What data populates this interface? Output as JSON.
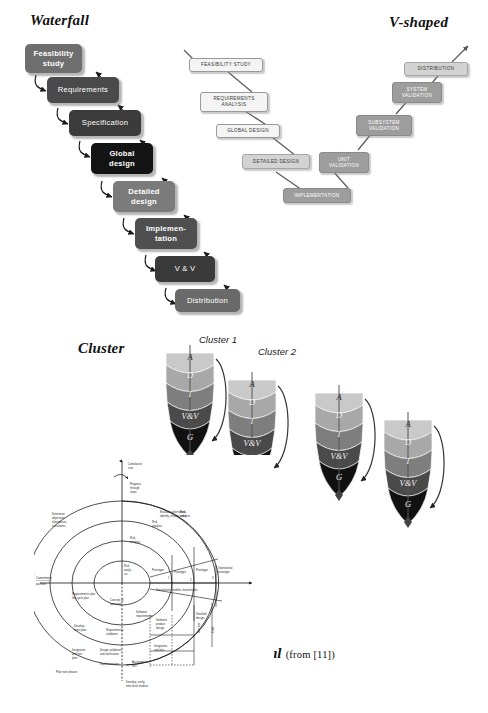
{
  "figure": {
    "background": "#ffffff"
  },
  "waterfall": {
    "title": "Waterfall",
    "boxes": [
      {
        "label": "Feasibility study",
        "line1": "Feasibility",
        "line2": "study",
        "fill": "#6e6e6e"
      },
      {
        "label": "Requirements",
        "line1": "Requirements",
        "line2": "",
        "fill": "#4a4a4a"
      },
      {
        "label": "Specification",
        "line1": "Specification",
        "line2": "",
        "fill": "#3b3b3b"
      },
      {
        "label": "Global design",
        "line1": "Global",
        "line2": "design",
        "fill": "#141414"
      },
      {
        "label": "Detailed design",
        "line1": "Detailed",
        "line2": "design",
        "fill": "#7b7b7b"
      },
      {
        "label": "Implementation",
        "line1": "Implemen-",
        "line2": "tation",
        "fill": "#4f4f4f"
      },
      {
        "label": "V & V",
        "line1": "V & V",
        "line2": "",
        "fill": "#3a3a3a"
      },
      {
        "label": "Distribution",
        "line1": "Distribution",
        "line2": "",
        "fill": "#6a6a6a"
      }
    ]
  },
  "vshaped": {
    "title": "V-shaped",
    "descending": [
      {
        "label": "FEASIBILITY STUDY",
        "line1": "FEASIBILITY STUDY",
        "line2": "",
        "tone": "light"
      },
      {
        "label": "REQUIREMENTS ANALYSIS",
        "line1": "REQUIREMENTS",
        "line2": "ANALYSIS",
        "tone": "light"
      },
      {
        "label": "GLOBAL DESIGN",
        "line1": "GLOBAL DESIGN",
        "line2": "",
        "tone": "light"
      },
      {
        "label": "DETAILED DESIGN",
        "line1": "DETAILED DESIGN",
        "line2": "",
        "tone": "mid"
      }
    ],
    "bottom": {
      "label": "IMPLEMENTATION",
      "line1": "IMPLEMENTATION",
      "line2": "",
      "tone": "dark"
    },
    "ascending": [
      {
        "label": "UNIT VALIDATION",
        "line1": "UNIT",
        "line2": "VALIDATION",
        "tone": "dark"
      },
      {
        "label": "SUBSYSTEM VALIDATION",
        "line1": "SUBSYSTEM",
        "line2": "VALIDATION",
        "tone": "dark"
      },
      {
        "label": "SYSTEM VALIDATION",
        "line1": "SYSTEM",
        "line2": "VALIDATION",
        "tone": "dark"
      },
      {
        "label": "DISTRIBUTION",
        "line1": "DISTRIBUTION",
        "line2": "",
        "tone": "mid"
      }
    ]
  },
  "cluster": {
    "title": "Cluster",
    "labels": [
      "Cluster 1",
      "Cluster 2"
    ],
    "phases": [
      {
        "label": "A",
        "fill": "#c9c9c9"
      },
      {
        "label": "D",
        "fill": "#a8a8a8"
      },
      {
        "label": "I",
        "fill": "#7e7e7e"
      },
      {
        "label": "V&V",
        "fill": "#4a4a4a"
      },
      {
        "label": "G",
        "fill": "#111111"
      }
    ],
    "cone_count": 4
  },
  "spiral": {
    "title": "Spiral",
    "citation": "(from [11])",
    "axis": {
      "cumulative_cost": "Cumulative cost",
      "progress": "Progress through steps",
      "commitment": "Commitment",
      "partition": "partition",
      "review": "Review"
    },
    "quadrants": {
      "top_left": "Determine objectives, alternatives, constraints",
      "top_right": "Evaluate alternatives, identify, resolve risks",
      "bottom_left": "Plan next phases",
      "bottom_right": "Develop, verify next-level product"
    },
    "risk_analyses": [
      "Risk analysis",
      "Risk analysis",
      "Risk analysis",
      "Risk analysis"
    ],
    "prototypes": [
      {
        "label": "Proto-type",
        "n": "1"
      },
      {
        "label": "Prototype",
        "n": "2"
      },
      {
        "label": "Prototype",
        "n": "3"
      },
      {
        "label": "Operational prototype",
        "n": ""
      }
    ],
    "center": {
      "l1": "Risk",
      "l2": "analy-",
      "l3": "sis"
    },
    "benchmarks": "Simulations, models, benchmarks",
    "plans": [
      "Requirements plan life-cycle plan",
      "Development plan",
      "Integration and test plan",
      "Plan next phases"
    ],
    "products": [
      "Concept of operation",
      "Software requirements",
      "Requirements validation",
      "Software product design",
      "Design validation and verification",
      "Detailed design",
      "Code",
      "Unit test",
      "Integration and test",
      "Acceptance test",
      "Implementation"
    ]
  }
}
